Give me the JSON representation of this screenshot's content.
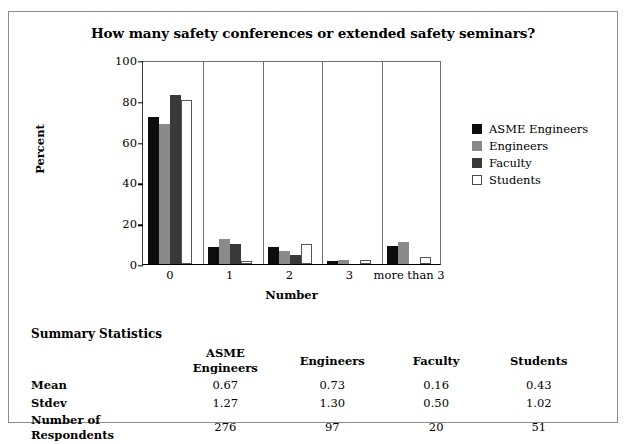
{
  "chart_data": {
    "type": "bar",
    "title": "How many safety conferences or extended safety seminars?",
    "xlabel": "Number",
    "ylabel": "Percent",
    "categories": [
      "0",
      "1",
      "2",
      "3",
      "more than 3"
    ],
    "series": [
      {
        "name": "ASME Engineers",
        "color": "#0d0d0d",
        "values": [
          72,
          8.5,
          8.3,
          1.5,
          9
        ]
      },
      {
        "name": "Engineers",
        "color": "#8a8a8a",
        "values": [
          68.5,
          12.5,
          6.5,
          2,
          11
        ]
      },
      {
        "name": "Faculty",
        "color": "#393939",
        "values": [
          83,
          10,
          4.5,
          0,
          0
        ]
      },
      {
        "name": "Students",
        "color": "#ffffff",
        "values": [
          80.5,
          1.5,
          10,
          2,
          3.5
        ]
      }
    ],
    "ylim": [
      0,
      100
    ],
    "yticks": [
      0,
      20,
      40,
      60,
      80,
      100
    ],
    "grid": false,
    "legend_position": "right"
  },
  "legend": {
    "items": [
      {
        "label": "ASME Engineers"
      },
      {
        "label": "Engineers"
      },
      {
        "label": "Faculty"
      },
      {
        "label": "Students"
      }
    ]
  },
  "summary": {
    "heading": "Summary Statistics",
    "columns": [
      "ASME Engineers",
      "Engineers",
      "Faculty",
      "Students"
    ],
    "rows": [
      {
        "label": "Mean",
        "values": [
          "0.67",
          "0.73",
          "0.16",
          "0.43"
        ]
      },
      {
        "label": "Stdev",
        "values": [
          "1.27",
          "1.30",
          "0.50",
          "1.02"
        ]
      },
      {
        "label": "Number of Respondents",
        "values": [
          "276",
          "97",
          "20",
          "51"
        ]
      }
    ]
  }
}
